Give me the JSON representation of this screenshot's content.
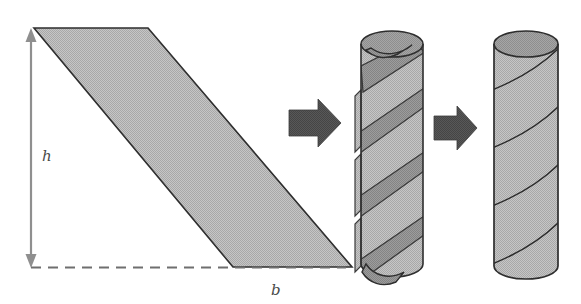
{
  "figure": {
    "caption": "",
    "labels": {
      "height_label": "h",
      "base_label": "b"
    },
    "colors": {
      "shape_fill": "#b9b9b9",
      "shape_stroke": "#2e2e2e",
      "strip_fill": "#8d8d8d",
      "cylinder_top_fill": "#9d9d9d",
      "cylinder_body_fill": "#bdbdbd",
      "arrow_fill": "#4f4f4f",
      "dimension_line": "#8a8a8a",
      "dashed_line": "#6f6f6f",
      "background": "#ffffff"
    },
    "elements": [
      {
        "name": "parallelogram",
        "kind": "shape",
        "vertices": "34,28 148,28 352,267 233,267"
      },
      {
        "name": "height-dimension",
        "kind": "double-headed-arrow",
        "from": "31,32",
        "to": "31,266",
        "label": "h"
      },
      {
        "name": "base-dimension",
        "kind": "dashed-line",
        "from": "31,267",
        "to": "352,267",
        "label": "b"
      },
      {
        "name": "arrow-1",
        "kind": "block-arrow",
        "direction": "right"
      },
      {
        "name": "twisted-cylinder",
        "kind": "cylinder",
        "description": "cylinder wrapped by a spiral strip, strip edges lifted"
      },
      {
        "name": "arrow-2",
        "kind": "block-arrow",
        "direction": "right"
      },
      {
        "name": "smooth-cylinder",
        "kind": "cylinder",
        "description": "finished cylinder with helical seam lines"
      }
    ]
  }
}
